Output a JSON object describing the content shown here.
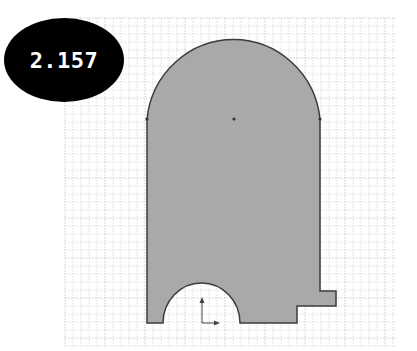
{
  "badge": {
    "label": "2.157",
    "background": "#000000",
    "text_color": "#ffffff"
  },
  "sketch": {
    "fill": "#a9a9a9",
    "stroke": "#3c3c3c",
    "grid": {
      "x0": 65,
      "y0": 18,
      "x1": 396,
      "y1": 346,
      "minor": 8,
      "minor_color": "#d4d4d4",
      "major_color": "#bdbdbd"
    },
    "outline_path": "M147 323 L147 119 A87 89 0 0 1 320 119 L320 291 L336 291 L336 306 L297 306 L297 323 L240 323 A38.5 40 0 0 0 163 323 Z",
    "vertices": [
      [
        147,
        119
      ],
      [
        234,
        119
      ],
      [
        320,
        119
      ]
    ],
    "origin": [
      202,
      323
    ]
  }
}
